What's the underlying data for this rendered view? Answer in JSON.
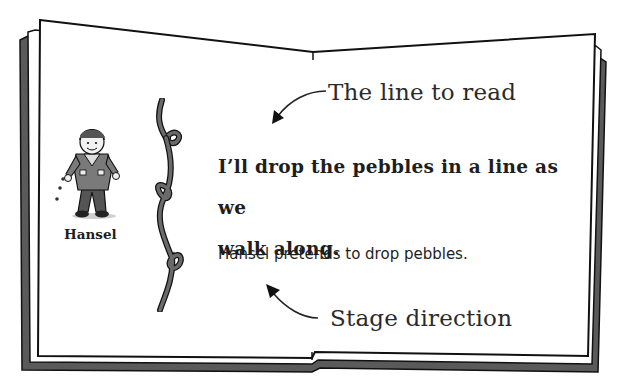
{
  "figure": {
    "type": "annotated open book illustration",
    "annotations": {
      "top": "The line to read",
      "bottom": "Stage direction"
    },
    "character": {
      "name": "Hansel",
      "icon": "boy-character-icon"
    },
    "script": {
      "line": "I’ll drop the pebbles in a line as we walk along.",
      "line_part1": "I’ll drop the pebbles in a line as we",
      "line_part2": "walk along.",
      "stage_direction": "Hansel pretends to drop pebbles."
    },
    "decorations": [
      "vine-divider-icon",
      "arrow-to-line-icon",
      "arrow-to-stage-direction-icon"
    ],
    "colors": {
      "page": "#ffffff",
      "outline": "#111111",
      "cover": "#5a5a5a",
      "text": "#1e1e1e"
    }
  }
}
